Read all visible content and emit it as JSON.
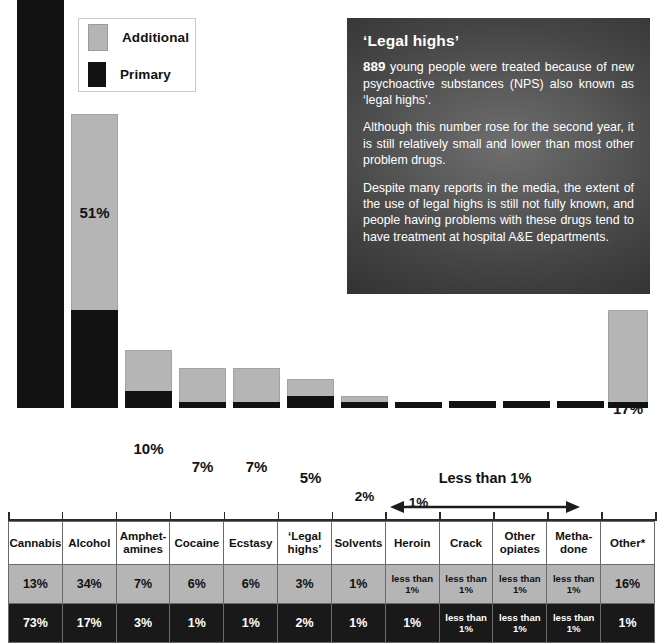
{
  "legend": {
    "items": [
      {
        "label": "Additional",
        "color": "#b5b5b5",
        "icon": "square-swatch-icon"
      },
      {
        "label": "Primary",
        "color": "#121212",
        "icon": "square-swatch-icon"
      }
    ]
  },
  "info_panel": {
    "title": "‘Legal highs’",
    "stat": "889",
    "paragraph1_rest": " young people were treated because of new psychoactive substances (NPS) also known as ‘legal highs’.",
    "paragraph2": "Although this number rose for the second year, it is still relatively small and lower than most other problem drugs.",
    "paragraph3": "Despite many reports in the media, the extent of the use of legal highs is still not fully known, and people having problems with these drugs tend to have treatment at hospital A&E departments."
  },
  "annotation": {
    "less_than_label": "Less than 1%"
  },
  "table": {
    "row_labels": [
      "Additional",
      "Primary"
    ],
    "headers": [
      "Cannabis",
      "Alcohol",
      "Amphet-amines",
      "Cocaine",
      "Ecstasy",
      "‘Legal highs’",
      "Solvents",
      "Heroin",
      "Crack",
      "Other opiates",
      "Metha-done",
      "Other*"
    ],
    "headers_lines": [
      [
        "Cannabis"
      ],
      [
        "Alcohol"
      ],
      [
        "Amphet-",
        "amines"
      ],
      [
        "Cocaine"
      ],
      [
        "Ecstasy"
      ],
      [
        "‘Legal",
        "highs’"
      ],
      [
        "Solvents"
      ],
      [
        "Heroin"
      ],
      [
        "Crack"
      ],
      [
        "Other",
        "opiates"
      ],
      [
        "Metha-",
        "done"
      ],
      [
        "Other*"
      ]
    ],
    "additional_row": [
      "13%",
      "34%",
      "7%",
      "6%",
      "6%",
      "3%",
      "1%",
      "less than 1%",
      "less than 1%",
      "less than 1%",
      "less than 1%",
      "16%"
    ],
    "primary_row": [
      "73%",
      "17%",
      "3%",
      "1%",
      "1%",
      "2%",
      "1%",
      "1%",
      "less than 1%",
      "less than 1%",
      "less than 1%",
      "1%"
    ]
  },
  "chart_data": {
    "type": "bar",
    "subtype": "stacked",
    "title": "",
    "xlabel": "",
    "ylabel": "",
    "ylim": [
      0,
      90
    ],
    "grid": false,
    "legend_position": "top-left",
    "categories": [
      "Cannabis",
      "Alcohol",
      "Amphetamines",
      "Cocaine",
      "Ecstasy",
      "'Legal highs'",
      "Solvents",
      "Heroin",
      "Crack",
      "Other opiates",
      "Methadone",
      "Other*"
    ],
    "series": [
      {
        "name": "Primary",
        "color": "#121212",
        "values": [
          73,
          17,
          3,
          1,
          1,
          2,
          1,
          1,
          0.5,
          0.5,
          0.5,
          1
        ]
      },
      {
        "name": "Additional",
        "color": "#b5b5b5",
        "values": [
          13,
          34,
          7,
          6,
          6,
          3,
          1,
          0.5,
          0.5,
          0.5,
          0.5,
          16
        ]
      }
    ],
    "totals": [
      86,
      51,
      10,
      7,
      7,
      5,
      2,
      1,
      0,
      0,
      0,
      17
    ],
    "total_labels": [
      "86%",
      "51%",
      "10%",
      "7%",
      "7%",
      "5%",
      "2%",
      "1%",
      "",
      "",
      "",
      "17%"
    ],
    "annotations": [
      {
        "text": "Less than 1%",
        "applies_to": [
          "Crack",
          "Other opiates",
          "Methadone"
        ],
        "style": "double-arrow"
      }
    ]
  },
  "bars": [
    {
      "name": "Cannabis",
      "left": 17,
      "width": 47,
      "total": 86,
      "primary": 73,
      "label": "86%",
      "label_size": "lg"
    },
    {
      "name": "Alcohol",
      "left": 71,
      "width": 47,
      "total": 51,
      "primary": 17,
      "label": "51%",
      "label_size": "lg"
    },
    {
      "name": "Amphetamines",
      "left": 125,
      "width": 47,
      "total": 10,
      "primary": 3,
      "label": "10%",
      "label_size": "lg"
    },
    {
      "name": "Cocaine",
      "left": 179,
      "width": 47,
      "total": 7,
      "primary": 1,
      "label": "7%",
      "label_size": "lg"
    },
    {
      "name": "Ecstasy",
      "left": 233,
      "width": 47,
      "total": 7,
      "primary": 1,
      "label": "7%",
      "label_size": "lg"
    },
    {
      "name": "Legal highs",
      "left": 287,
      "width": 47,
      "total": 5,
      "primary": 2,
      "label": "5%",
      "label_size": "lg"
    },
    {
      "name": "Solvents",
      "left": 341,
      "width": 47,
      "total": 2,
      "primary": 1,
      "label": "2%",
      "label_size": "sm"
    },
    {
      "name": "Heroin",
      "left": 395,
      "width": 47,
      "total": 1,
      "primary": 1,
      "label": "1%",
      "label_size": "sm"
    },
    {
      "name": "Crack",
      "left": 449,
      "width": 47,
      "total": 0,
      "primary": 0,
      "label": "",
      "label_size": "sm"
    },
    {
      "name": "Other opiates",
      "left": 503,
      "width": 47,
      "total": 0,
      "primary": 0,
      "label": "",
      "label_size": "sm"
    },
    {
      "name": "Methadone",
      "left": 557,
      "width": 47,
      "total": 0,
      "primary": 0,
      "label": "",
      "label_size": "sm"
    },
    {
      "name": "Other",
      "left": 608,
      "width": 40,
      "total": 17,
      "primary": 1,
      "label": "17%",
      "label_size": "lg"
    }
  ]
}
